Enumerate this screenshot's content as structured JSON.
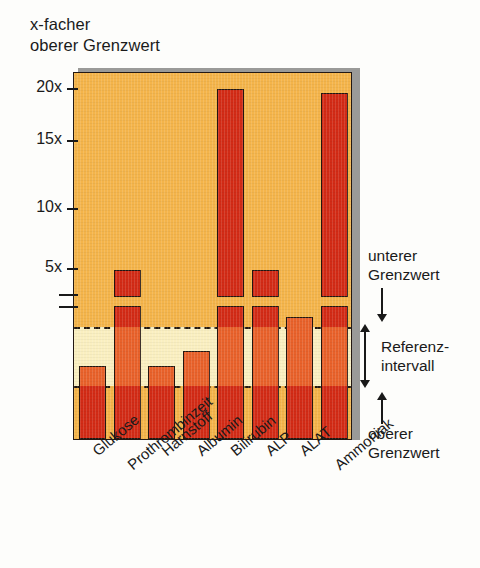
{
  "chart_data": {
    "type": "bar",
    "title_line1": "x-facher",
    "title_line2": "oberer Grenzwert",
    "xlabel": "",
    "ylabel": "x-facher oberer Grenzwert",
    "ylim": [
      0,
      21
    ],
    "grid": false,
    "legend": "none",
    "axis_break": {
      "present": true,
      "note": "Achsenbruch zwischen Referenzbereich und oberer Skala"
    },
    "categories": [
      "Glukose",
      "Prothrombinzeit",
      "Harnstoff",
      "Albumin",
      "Bilirubin",
      "ALP",
      "ALAT",
      "Ammoniak"
    ],
    "values": [
      0.5,
      4.9,
      0.5,
      0.62,
      20.0,
      4.9,
      1.0,
      19.7
    ],
    "tick_labels": [
      "20x",
      "15x",
      "10x",
      "5x"
    ],
    "tick_values": [
      20,
      15,
      10,
      5
    ],
    "reference_interval": {
      "label": "Referenz-\nintervall",
      "upper_label": "unterer\nGrenzwert",
      "lower_label": "oberer\nGrenzwert"
    }
  },
  "annotations": {
    "upper_limit_line1": "unterer",
    "upper_limit_line2": "Grenzwert",
    "ref_line1": "Referenz-",
    "ref_line2": "intervall",
    "lower_limit_line1": "oberer",
    "lower_limit_line2": "Grenzwert"
  },
  "colors": {
    "bar_outside": "#d22b16",
    "bar_inside": "#e8612a",
    "plot_background": "#f4b44a",
    "reference_band": "#faefc0",
    "outline": "#241610",
    "shadow": "#9a9a98",
    "text": "#1a1a1a"
  }
}
